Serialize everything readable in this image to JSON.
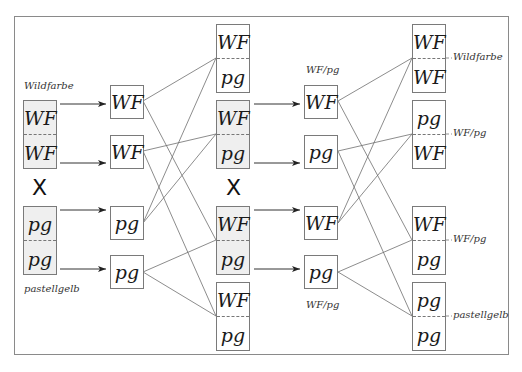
{
  "parents": {
    "top": {
      "label": "Wildfarbe",
      "alleles": [
        "WF",
        "WF"
      ]
    },
    "bottom": {
      "label": "pastellgelb",
      "alleles": [
        "pg",
        "pg"
      ]
    },
    "cross_symbol": "X"
  },
  "gametes_p": [
    "WF",
    "WF",
    "pg",
    "pg"
  ],
  "f1": {
    "boxes": [
      {
        "alleles": [
          "WF",
          "pg"
        ],
        "selected": false
      },
      {
        "alleles": [
          "WF",
          "pg"
        ],
        "selected": true
      },
      {
        "alleles": [
          "WF",
          "pg"
        ],
        "selected": true
      },
      {
        "alleles": [
          "WF",
          "pg"
        ],
        "selected": false
      }
    ],
    "cross_symbol": "X"
  },
  "gametes_f1": {
    "label_top": "WF/pg",
    "label_bottom": "WF/pg",
    "alleles": [
      "WF",
      "pg",
      "WF",
      "pg"
    ]
  },
  "f2": {
    "boxes": [
      {
        "alleles": [
          "WF",
          "WF"
        ],
        "label": "Wildfarbe"
      },
      {
        "alleles": [
          "pg",
          "WF"
        ],
        "label": "WF/pg"
      },
      {
        "alleles": [
          "WF",
          "pg"
        ],
        "label": "WF/pg"
      },
      {
        "alleles": [
          "pg",
          "pg"
        ],
        "label": "pastellgelb"
      }
    ]
  },
  "colors": {
    "line": "#6e6e6e",
    "frame": "#8a8a8a",
    "selected_fill": "#efefef"
  }
}
